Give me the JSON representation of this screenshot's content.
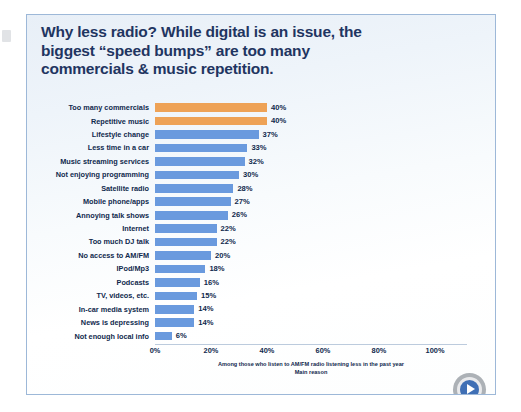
{
  "slide": {
    "title_lines": [
      "Why less radio? While digital is an issue, the",
      "biggest “speed bumps” are too many",
      "commercials & music repetition."
    ],
    "title_color": "#1f3561",
    "logo_icon": "play-circle-logo"
  },
  "chart_data": {
    "type": "bar",
    "orientation": "horizontal",
    "title": "Why less radio? While digital is an issue, the biggest “speed bumps” are too many commercials & music repetition.",
    "xlabel": "",
    "ylabel": "",
    "xlim": [
      0,
      100
    ],
    "grid": false,
    "legend": "none",
    "categories": [
      "Too many commercials",
      "Repetitive music",
      "Lifestyle change",
      "Less time in a car",
      "Music streaming services",
      "Not enjoying programming",
      "Satellite radio",
      "Mobile phone/apps",
      "Annoying talk shows",
      "Internet",
      "Too much DJ talk",
      "No access to AM/FM",
      "IPod/Mp3",
      "Podcasts",
      "TV, videos, etc.",
      "In-car media system",
      "News is depressing",
      "Not enough local info"
    ],
    "values": [
      40,
      40,
      37,
      33,
      32,
      30,
      28,
      27,
      26,
      22,
      22,
      20,
      18,
      16,
      15,
      14,
      14,
      6
    ],
    "value_labels": [
      "40%",
      "40%",
      "37%",
      "33%",
      "32%",
      "30%",
      "28%",
      "27%",
      "26%",
      "22%",
      "22%",
      "20%",
      "18%",
      "16%",
      "15%",
      "14%",
      "14%",
      "6%"
    ],
    "bar_colors": [
      "#eea256",
      "#eea256",
      "#6a9ade",
      "#6a9ade",
      "#6a9ade",
      "#6a9ade",
      "#6a9ade",
      "#6a9ade",
      "#6a9ade",
      "#6a9ade",
      "#6a9ade",
      "#6a9ade",
      "#6a9ade",
      "#6a9ade",
      "#6a9ade",
      "#6a9ade",
      "#6a9ade",
      "#6a9ade"
    ],
    "highlight_color": "#eea256",
    "series_color": "#6a9ade",
    "xticks": [
      0,
      20,
      40,
      60,
      80,
      100
    ],
    "xtick_labels": [
      "0%",
      "20%",
      "40%",
      "60%",
      "80%",
      "100%"
    ],
    "annotations": [
      "Among those who listen to AM/FM  radio listening less in the past year",
      "Main reason"
    ]
  }
}
